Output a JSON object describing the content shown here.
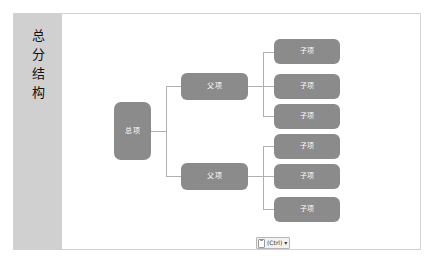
{
  "document": {
    "side_panel": {
      "label": "总\n分\n结\n构"
    }
  },
  "diagram": {
    "type": "hierarchy-org-chart",
    "node_fill_color": "#8b8b8b",
    "node_text_color": "#ffffff",
    "connector_color": "#b0b0b0",
    "canvas_border_color": "#d2d2d2",
    "side_panel_color": "#d0d0d0",
    "root": {
      "label": "总项"
    },
    "parents": [
      {
        "label": "父项"
      },
      {
        "label": "父项"
      }
    ],
    "children": [
      {
        "label": "子项"
      },
      {
        "label": "子项"
      },
      {
        "label": "子项"
      },
      {
        "label": "子项"
      },
      {
        "label": "子项"
      },
      {
        "label": "子项"
      }
    ]
  },
  "paste_options": {
    "icon": "clipboard-icon",
    "text": "(Ctrl)",
    "caret": "▾"
  }
}
